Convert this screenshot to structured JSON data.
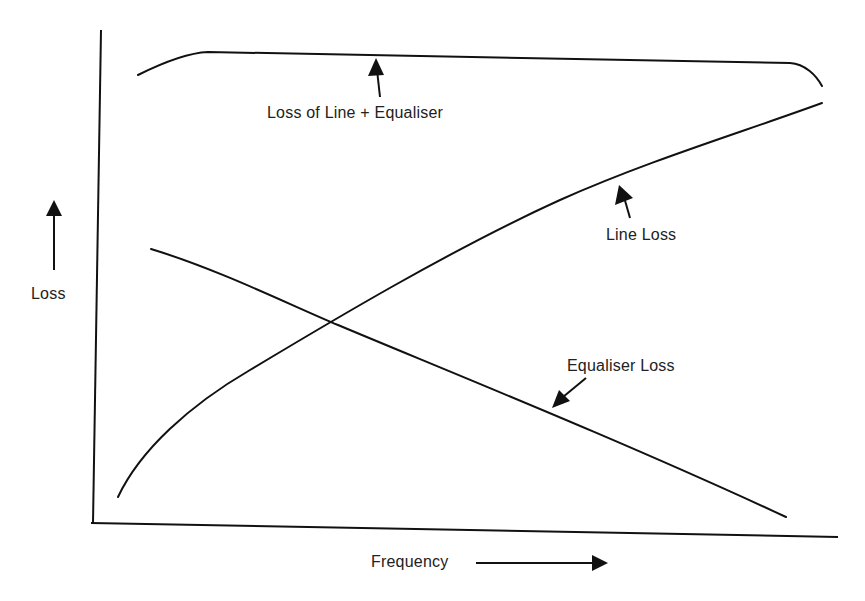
{
  "diagram": {
    "title": "",
    "axes": {
      "x_label": "Frequency",
      "y_label": "Loss"
    },
    "curves": [
      {
        "id": "total",
        "label": "Loss of Line + Equaliser",
        "trend": "rises quickly then flat, drops at high end"
      },
      {
        "id": "line",
        "label": "Line Loss",
        "trend": "increasing with frequency"
      },
      {
        "id": "equaliser",
        "label": "Equaliser Loss",
        "trend": "decreasing with frequency"
      }
    ],
    "annotations": {
      "total": "Loss of Line + Equaliser",
      "line": "Line Loss",
      "equaliser": "Equaliser Loss"
    },
    "colors": {
      "ink": "#111111",
      "paper": "#ffffff"
    }
  }
}
